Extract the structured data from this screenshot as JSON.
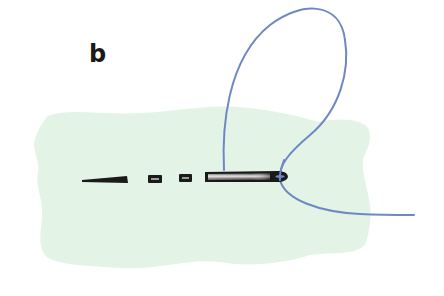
{
  "figure": {
    "panel_label": "b",
    "colors": {
      "fabric": "#e3f4e6",
      "thread": "#6f88c4",
      "stitch": "#1a1a1a",
      "needle_dark": "#1a1a1a",
      "needle_highlight": "#d9d9d9",
      "background": "#ffffff"
    },
    "elements": [
      {
        "name": "fabric",
        "type": "shape"
      },
      {
        "name": "stitch-1",
        "type": "stitch",
        "shape": "long tapered dash"
      },
      {
        "name": "stitch-2",
        "type": "stitch",
        "shape": "small box"
      },
      {
        "name": "stitch-3",
        "type": "stitch",
        "shape": "small box"
      },
      {
        "name": "needle",
        "type": "needle"
      },
      {
        "name": "thread",
        "type": "thread",
        "shape": "loop"
      }
    ]
  }
}
